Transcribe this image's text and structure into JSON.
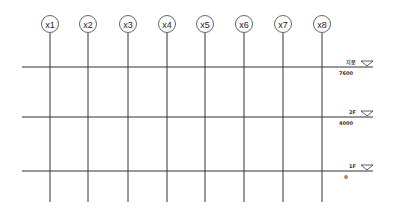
{
  "diagram": {
    "type": "structural-grid-elevation",
    "grid_axes": [
      {
        "label": "x1",
        "x": 50
      },
      {
        "label": "x2",
        "x": 88
      },
      {
        "label": "x3",
        "x": 128
      },
      {
        "label": "x4",
        "x": 167
      },
      {
        "label": "x5",
        "x": 205
      },
      {
        "label": "x6",
        "x": 244
      },
      {
        "label": "x7",
        "x": 283
      },
      {
        "label": "x8",
        "x": 322
      }
    ],
    "levels": [
      {
        "name": "지붕",
        "elevation": "7600",
        "y": 67
      },
      {
        "name": "2F",
        "elevation": "4000",
        "y": 117
      },
      {
        "name": "1F",
        "elevation": "0",
        "y": 171
      }
    ],
    "colors": {
      "line": "#333333",
      "circle": "#555555",
      "background": "#ffffff"
    }
  }
}
